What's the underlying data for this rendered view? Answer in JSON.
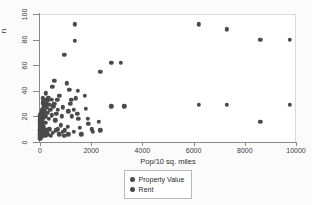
{
  "chart_data": {
    "type": "scatter",
    "title": "",
    "xlabel": "Pop/10 sq. miles",
    "ylabel": "n",
    "xlim": [
      0,
      10000
    ],
    "ylim": [
      0,
      100
    ],
    "grid": false,
    "legend_position": "bottom-center",
    "xticks": [
      {
        "value": 0,
        "label": "0"
      },
      {
        "value": 2000,
        "label": "2000"
      },
      {
        "value": 4000,
        "label": "4000"
      },
      {
        "value": 6000,
        "label": "6000"
      },
      {
        "value": 8000,
        "label": "8000"
      },
      {
        "value": 10000,
        "label": "10000"
      }
    ],
    "yticks": [
      {
        "value": 0,
        "label": "0"
      },
      {
        "value": 20,
        "label": "20"
      },
      {
        "value": 40,
        "label": "40"
      },
      {
        "value": 60,
        "label": "60"
      },
      {
        "value": 80,
        "label": "80"
      },
      {
        "value": 100,
        "label": "100"
      }
    ],
    "marker_color": "#4a4a4a",
    "plot_background": "#ffffff",
    "figure_background": "#fbfbfb",
    "series": [
      {
        "name": "Property Value",
        "color": "#4a4a4a",
        "points": [
          [
            1350,
            92
          ],
          [
            1350,
            79
          ],
          [
            950,
            68
          ],
          [
            2780,
            62
          ],
          [
            3150,
            62
          ],
          [
            2350,
            55
          ],
          [
            6200,
            92
          ],
          [
            7300,
            88
          ],
          [
            8600,
            80
          ],
          [
            9750,
            80
          ],
          [
            560,
            48
          ],
          [
            1050,
            46
          ],
          [
            480,
            43
          ],
          [
            1150,
            41
          ],
          [
            1480,
            40
          ],
          [
            220,
            38
          ],
          [
            760,
            36
          ],
          [
            330,
            34
          ],
          [
            1230,
            33
          ],
          [
            1760,
            36
          ],
          [
            6200,
            29
          ],
          [
            7300,
            29
          ],
          [
            9750,
            29
          ],
          [
            8600,
            16
          ],
          [
            2780,
            28
          ],
          [
            3300,
            28
          ],
          [
            1800,
            26
          ],
          [
            1870,
            18
          ],
          [
            1880,
            14
          ],
          [
            2300,
            16
          ],
          [
            1450,
            22
          ],
          [
            1500,
            18
          ],
          [
            1250,
            20
          ],
          [
            1100,
            24
          ],
          [
            900,
            27
          ],
          [
            850,
            20
          ],
          [
            700,
            25
          ],
          [
            640,
            22
          ],
          [
            600,
            17
          ],
          [
            520,
            28
          ],
          [
            460,
            21
          ],
          [
            400,
            25
          ],
          [
            350,
            18
          ],
          [
            300,
            23
          ],
          [
            260,
            27
          ],
          [
            230,
            20
          ],
          [
            200,
            15
          ],
          [
            180,
            24
          ],
          [
            160,
            19
          ],
          [
            150,
            12
          ],
          [
            140,
            28
          ],
          [
            130,
            22
          ],
          [
            120,
            16
          ],
          [
            110,
            26
          ],
          [
            100,
            20
          ],
          [
            95,
            14
          ],
          [
            90,
            24
          ],
          [
            85,
            18
          ],
          [
            80,
            11
          ],
          [
            75,
            22
          ],
          [
            70,
            16
          ],
          [
            65,
            25
          ],
          [
            60,
            19
          ],
          [
            58,
            13
          ],
          [
            55,
            21
          ],
          [
            52,
            15
          ],
          [
            50,
            9
          ],
          [
            48,
            23
          ],
          [
            45,
            17
          ],
          [
            42,
            11
          ],
          [
            40,
            20
          ],
          [
            38,
            14
          ],
          [
            36,
            8
          ],
          [
            34,
            18
          ],
          [
            32,
            12
          ],
          [
            30,
            22
          ],
          [
            28,
            16
          ],
          [
            26,
            10
          ],
          [
            24,
            19
          ],
          [
            22,
            13
          ],
          [
            20,
            7
          ],
          [
            18,
            17
          ],
          [
            16,
            11
          ],
          [
            14,
            21
          ],
          [
            12,
            15
          ],
          [
            10,
            9
          ],
          [
            9,
            18
          ],
          [
            8,
            12
          ],
          [
            7,
            6
          ],
          [
            6,
            16
          ],
          [
            5,
            10
          ],
          [
            4,
            20
          ],
          [
            3,
            14
          ],
          [
            2,
            8
          ],
          [
            1,
            12
          ],
          [
            1,
            5
          ],
          [
            2,
            17
          ],
          [
            3,
            9
          ],
          [
            4,
            13
          ],
          [
            700,
            10
          ],
          [
            820,
            13
          ],
          [
            980,
            9
          ],
          [
            1080,
            12
          ],
          [
            1320,
            8
          ],
          [
            1550,
            11
          ],
          [
            1620,
            6
          ],
          [
            1100,
            6
          ],
          [
            950,
            5
          ],
          [
            880,
            8
          ],
          [
            760,
            6
          ],
          [
            620,
            9
          ],
          [
            500,
            7
          ],
          [
            420,
            5
          ],
          [
            360,
            10
          ],
          [
            300,
            6
          ],
          [
            250,
            9
          ],
          [
            210,
            5
          ],
          [
            170,
            8
          ],
          [
            145,
            6
          ],
          [
            125,
            10
          ],
          [
            105,
            7
          ],
          [
            88,
            5
          ],
          [
            72,
            9
          ],
          [
            62,
            6
          ],
          [
            54,
            4
          ],
          [
            46,
            8
          ],
          [
            40,
            5
          ],
          [
            34,
            7
          ],
          [
            28,
            4
          ],
          [
            23,
            9
          ],
          [
            19,
            6
          ],
          [
            15,
            4
          ],
          [
            12,
            8
          ],
          [
            9,
            5
          ],
          [
            7,
            3
          ],
          [
            5,
            7
          ],
          [
            3,
            4
          ],
          [
            2,
            6
          ],
          [
            1,
            3
          ],
          [
            1180,
            30
          ],
          [
            1320,
            25
          ],
          [
            1400,
            34
          ],
          [
            670,
            33
          ],
          [
            560,
            30
          ],
          [
            450,
            33
          ],
          [
            390,
            29
          ],
          [
            300,
            32
          ],
          [
            240,
            30
          ],
          [
            195,
            33
          ],
          [
            155,
            29
          ],
          [
            135,
            31
          ],
          [
            115,
            34
          ],
          [
            98,
            30
          ],
          [
            2030,
            10
          ],
          [
            2060,
            8
          ],
          [
            2350,
            9
          ]
        ]
      },
      {
        "name": "Rent",
        "color": "#4a4a4a",
        "points": []
      }
    ]
  },
  "legend": {
    "items": [
      {
        "label": "Property Value"
      },
      {
        "label": "Rent"
      }
    ]
  }
}
